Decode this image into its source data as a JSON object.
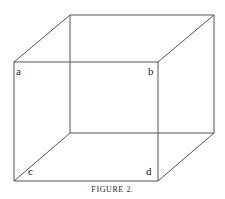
{
  "figure": {
    "caption": "FIGURE 2.",
    "background_color": "#ffffff",
    "line_color": "#555555",
    "label_color": "#1a1a1a",
    "width": 225,
    "height": 199,
    "labels": {
      "a": "a",
      "b": "b",
      "c": "c",
      "d": "d"
    },
    "vertices": {
      "front_top_left": {
        "name": "a",
        "x": 14,
        "y": 62
      },
      "front_top_right": {
        "name": "b",
        "x": 158,
        "y": 62
      },
      "front_bottom_left": {
        "name": "",
        "x": 14,
        "y": 181
      },
      "front_bottom_right": {
        "name": "d",
        "x": 158,
        "y": 181
      },
      "back_top_left": {
        "name": "",
        "x": 70,
        "y": 15
      },
      "back_top_right": {
        "name": "",
        "x": 214,
        "y": 15
      },
      "back_bottom_left": {
        "name": "c",
        "x": 70,
        "y": 133
      },
      "back_bottom_right": {
        "name": "",
        "x": 214,
        "y": 133
      }
    },
    "edges": [
      {
        "name": "front-top",
        "x1": 14,
        "y1": 62,
        "x2": 158,
        "y2": 62
      },
      {
        "name": "front-right",
        "x1": 158,
        "y1": 62,
        "x2": 158,
        "y2": 181
      },
      {
        "name": "front-bottom",
        "x1": 158,
        "y1": 181,
        "x2": 14,
        "y2": 181
      },
      {
        "name": "front-left",
        "x1": 14,
        "y1": 181,
        "x2": 14,
        "y2": 62
      },
      {
        "name": "back-top",
        "x1": 70,
        "y1": 15,
        "x2": 214,
        "y2": 15
      },
      {
        "name": "back-right",
        "x1": 214,
        "y1": 15,
        "x2": 214,
        "y2": 133
      },
      {
        "name": "back-bottom",
        "x1": 214,
        "y1": 133,
        "x2": 70,
        "y2": 133
      },
      {
        "name": "back-left",
        "x1": 70,
        "y1": 133,
        "x2": 70,
        "y2": 15
      },
      {
        "name": "connector-top-left",
        "x1": 14,
        "y1": 62,
        "x2": 70,
        "y2": 15
      },
      {
        "name": "connector-top-right",
        "x1": 158,
        "y1": 62,
        "x2": 214,
        "y2": 15
      },
      {
        "name": "connector-bottom-left",
        "x1": 14,
        "y1": 181,
        "x2": 70,
        "y2": 133
      },
      {
        "name": "connector-bottom-right",
        "x1": 158,
        "y1": 181,
        "x2": 214,
        "y2": 133
      }
    ]
  }
}
